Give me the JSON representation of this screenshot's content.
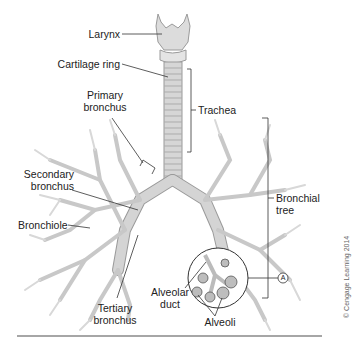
{
  "diagram": {
    "labels": {
      "larynx": "Larynx",
      "cartilage_ring": "Cartilage ring",
      "primary_bronchus_1": "Primary",
      "primary_bronchus_2": "bronchus",
      "trachea": "Trachea",
      "secondary_bronchus_1": "Secondary",
      "secondary_bronchus_2": "bronchus",
      "bronchiole": "Bronchiole",
      "bronchial_tree_1": "Bronchial",
      "bronchial_tree_2": "tree",
      "tertiary_bronchus_1": "Tertiary",
      "tertiary_bronchus_2": "bronchus",
      "alveolar_duct_1": "Alveolar",
      "alveolar_duct_2": "duct",
      "alveoli": "Alveoli",
      "inset_marker": "A"
    },
    "copyright": "© Cengage Learning 2014",
    "colors": {
      "airway_fill": "#d4d4d4",
      "airway_stroke": "#9a9a9a",
      "leader_line": "#333333",
      "alveoli": "#666666"
    }
  }
}
